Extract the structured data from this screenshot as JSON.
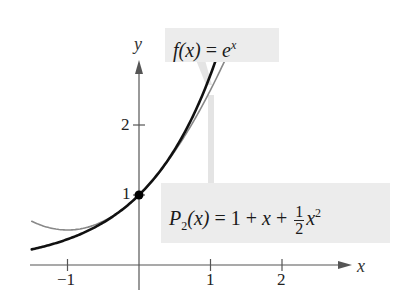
{
  "chart_data": {
    "type": "line",
    "title": "",
    "xlabel": "x",
    "ylabel": "y",
    "xlim": [
      -1.55,
      2.65
    ],
    "ylim": [
      -0.2,
      2.55
    ],
    "x_ticks": [
      -1,
      1,
      2
    ],
    "x_tick_labels": [
      "−1",
      "1",
      "2"
    ],
    "y_ticks": [
      1,
      2
    ],
    "y_tick_labels": [
      "1",
      "2"
    ],
    "grid": false,
    "series": [
      {
        "name": "f(x) = e^x",
        "color": "#111111",
        "style": "thick",
        "x": [
          -1.5,
          -1.25,
          -1.0,
          -0.75,
          -0.5,
          -0.25,
          0.0,
          0.25,
          0.5,
          0.75,
          1.0,
          1.1
        ],
        "values": [
          0.22,
          0.29,
          0.37,
          0.47,
          0.61,
          0.78,
          1.0,
          1.28,
          1.65,
          2.12,
          2.72,
          3.0
        ]
      },
      {
        "name": "P2(x) = 1 + x + (1/2)x^2",
        "color": "#888888",
        "style": "thin",
        "x": [
          -1.5,
          -1.25,
          -1.0,
          -0.75,
          -0.5,
          -0.25,
          0.0,
          0.25,
          0.5,
          0.75,
          1.0,
          1.2
        ],
        "values": [
          0.625,
          0.53,
          0.5,
          0.53,
          0.625,
          0.78,
          1.0,
          1.28,
          1.625,
          2.03,
          2.5,
          2.92
        ]
      }
    ],
    "points": [
      {
        "x": 0,
        "y": 1,
        "label": "(0, 1)"
      }
    ],
    "annotations": [
      {
        "text": "f(x) = e^x",
        "target_series": 0
      },
      {
        "text": "P2(x) = 1 + x + 1/2 x^2",
        "target_series": 1
      }
    ]
  },
  "labels": {
    "f_name": "f",
    "f_arg": "(x)",
    "f_eq": " = ",
    "f_base": "e",
    "f_exp": "x",
    "p_name": "P",
    "p_sub": "2",
    "p_arg": "(x)",
    "p_eq": " = 1 + ",
    "p_x": "x",
    "p_plus": " + ",
    "p_num": "1",
    "p_den": "2",
    "p_x2": "x",
    "p_exp": "2"
  },
  "axes": {
    "x_label": "x",
    "y_label": "y"
  }
}
